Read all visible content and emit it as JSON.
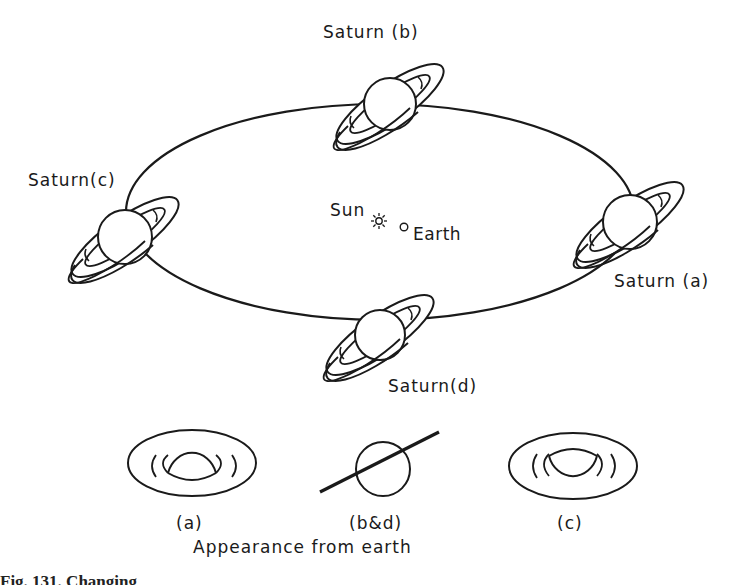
{
  "diagram": {
    "orbit_labels": {
      "a": "Saturn (a)",
      "b": "Saturn (b)",
      "c": "Saturn(c)",
      "d": "Saturn(d)"
    },
    "center": {
      "sun_label": "Sun",
      "earth_label": "Earth"
    },
    "appearance": {
      "a_label": "(a)",
      "bd_label": "(b&d)",
      "c_label": "(c)",
      "title": "Appearance from earth"
    },
    "caption_fragment": "Fig. 131. Changing"
  }
}
